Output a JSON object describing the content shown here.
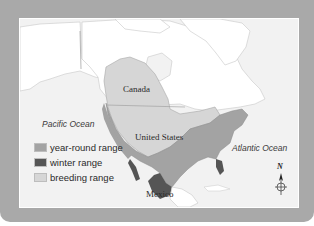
{
  "map": {
    "countries": [
      {
        "name": "Canada"
      },
      {
        "name": "United States"
      },
      {
        "name": "Mexico"
      }
    ],
    "oceans": [
      {
        "name": "Pacific Ocean"
      },
      {
        "name": "Atlantic Ocean"
      }
    ],
    "legend": [
      {
        "label": "year-round range",
        "color": "#a3a3a3"
      },
      {
        "label": "winter range",
        "color": "#555555"
      },
      {
        "label": "breeding range",
        "color": "#d6d6d6"
      }
    ],
    "compass": {
      "label": "N"
    },
    "colors": {
      "frame": "#a9a9a9",
      "sea": "#f2f2f2",
      "land": "#ffffff",
      "year_round": "#a3a3a3",
      "winter": "#555555",
      "breeding": "#d6d6d6"
    }
  }
}
